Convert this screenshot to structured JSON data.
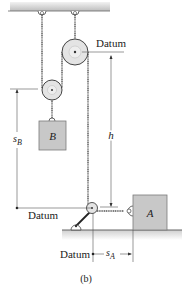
{
  "diagram": {
    "caption": "(b)",
    "labels": {
      "datum_top": "Datum",
      "datum_left": "Datum",
      "datum_bottom": "Datum",
      "block_b": "B",
      "block_a": "A",
      "h": "h",
      "s_b_main": "s",
      "s_b_sub": "B",
      "s_a_main": "s",
      "s_a_sub": "A"
    },
    "colors": {
      "block_fill": "#c8c8c8",
      "block_stroke": "#7a7a7a",
      "pulley_fill": "#e4e4e4",
      "rope": "#555555",
      "ceiling": "#9a9a9a",
      "dim_line": "#444444"
    }
  }
}
